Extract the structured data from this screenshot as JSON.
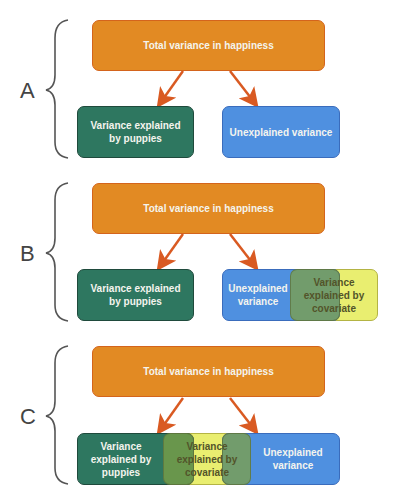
{
  "colors": {
    "orange": "#e28a23",
    "green": "#2e7760",
    "blue": "#4f90e0",
    "yellow": "#e9ee70",
    "arrow": "#d95a22"
  },
  "panels": [
    {
      "label": "A",
      "top": "Total variance in happiness",
      "left": "Variance explained by puppies",
      "right": "Unexplained variance"
    },
    {
      "label": "B",
      "top": "Total variance in happiness",
      "left": "Variance explained by puppies",
      "right": "Unexplained variance",
      "covariate": "Variance explained by covariate"
    },
    {
      "label": "C",
      "top": "Total variance in happiness",
      "left": "Variance explained by puppies",
      "right": "Unexplained variance",
      "covariate": "Variance explained by covariate"
    }
  ]
}
